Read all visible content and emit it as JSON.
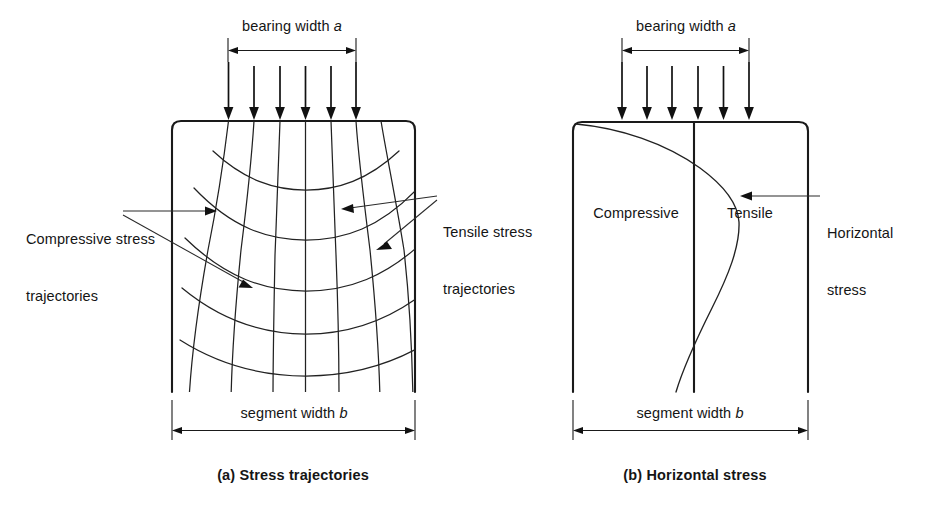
{
  "figure": {
    "background_color": "#ffffff",
    "ink_color": "#1a1a1a",
    "panels": [
      {
        "id": "a",
        "caption": "(a) Stress trajectories",
        "top_dimension_label": "bearing width a",
        "bottom_dimension_label": "segment width b",
        "load_arrow_count": 6,
        "callouts": [
          {
            "id": "compressive",
            "line1": "Compressive stress",
            "line2": "trajectories"
          },
          {
            "id": "tensile",
            "line1": "Tensile stress",
            "line2": "trajectories"
          }
        ]
      },
      {
        "id": "b",
        "caption": "(b) Horizontal stress",
        "top_dimension_label": "bearing width a",
        "bottom_dimension_label": "segment width b",
        "load_arrow_count": 6,
        "zone_labels": [
          {
            "id": "compressive",
            "text": "Compressive"
          },
          {
            "id": "tensile",
            "text": "Tensile"
          }
        ],
        "callouts": [
          {
            "id": "horizontal-stress",
            "line1": "Horizontal",
            "line2": "stress"
          }
        ]
      }
    ]
  },
  "labels": {
    "bearing_width_left": "bearing width ",
    "bearing_width_symbol": "a",
    "segment_width_left": "segment width ",
    "segment_width_symbol": "b",
    "caption_a": "(a) Stress trajectories",
    "caption_b": "(b) Horizontal stress",
    "compressive_stress_line1": "Compressive stress",
    "compressive_stress_line2": "trajectories",
    "tensile_stress_line1": "Tensile stress",
    "tensile_stress_line2": "trajectories",
    "zone_compressive": "Compressive",
    "zone_tensile": "Tensile",
    "horizontal_stress_line1": "Horizontal",
    "horizontal_stress_line2": "stress"
  }
}
